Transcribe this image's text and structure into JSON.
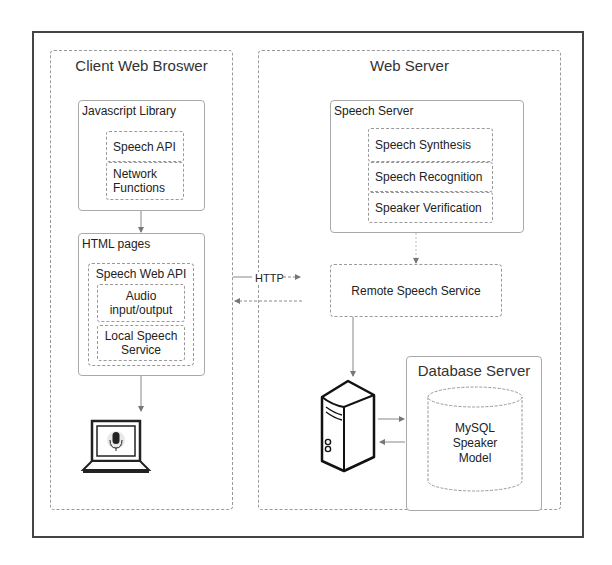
{
  "client": {
    "title": "Client Web Broswer",
    "js_library": {
      "title": "Javascript Library",
      "items": [
        "Speech API",
        "Network Functions"
      ]
    },
    "html_pages": {
      "title": "HTML pages",
      "speech_web_api": {
        "title": "Speech Web API",
        "items": [
          "Audio input/output",
          "Local Speech Service"
        ]
      }
    },
    "device_icon": "laptop-microphone-icon"
  },
  "connection": {
    "protocol_label": "HTTP"
  },
  "server": {
    "title": "Web Server",
    "speech_server": {
      "title": "Speech Server",
      "items": [
        "Speech Synthesis",
        "Speech Recognition",
        "Speaker Verification"
      ]
    },
    "remote_service": "Remote Speech Service",
    "server_icon": "server-tower-icon",
    "database_server": {
      "title": "Database Server",
      "db_label": "MySQL Speaker Model"
    }
  }
}
